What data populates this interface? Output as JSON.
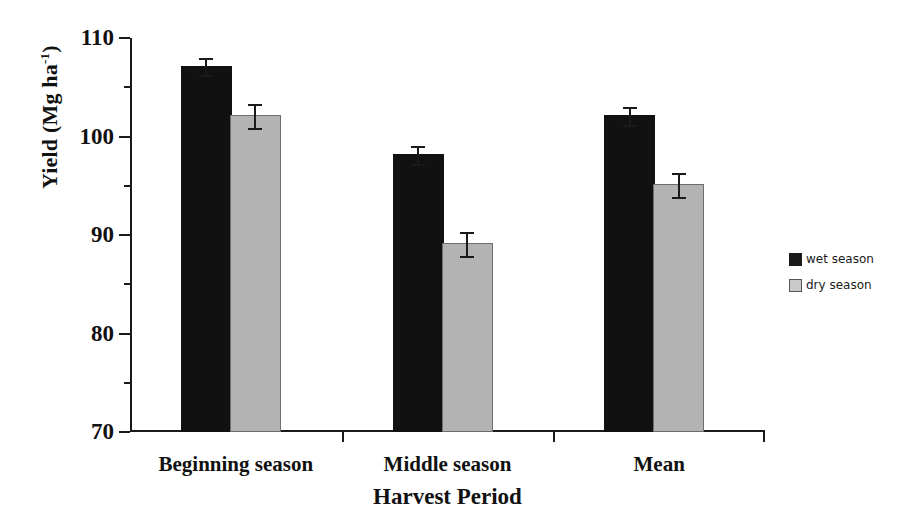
{
  "chart_data": {
    "type": "bar",
    "title": "",
    "xlabel": "Harvest Period",
    "ylabel": "Yield (Mg ha",
    "ylabel_sup": "-1",
    "ylabel_close": ")",
    "categories": [
      "Beginning season",
      "Middle season",
      "Mean"
    ],
    "series": [
      {
        "name": "wet season",
        "color": "#111111",
        "values": [
          107,
          98,
          102
        ],
        "errors": [
          1.0,
          1.0,
          1.0
        ]
      },
      {
        "name": "dry season",
        "color": "#b3b3b3",
        "values": [
          102,
          89,
          95
        ],
        "errors": [
          1.3,
          1.3,
          1.3
        ]
      }
    ],
    "ylim": [
      70,
      110
    ],
    "ytick_labels": [
      "70",
      "80",
      "90",
      "100",
      "110"
    ],
    "ytick_values": [
      70,
      80,
      90,
      100,
      110
    ],
    "yminor_values": [
      75,
      85,
      95,
      105
    ],
    "grid": false,
    "legend_position": "right"
  },
  "legend": {
    "items": [
      {
        "label": "wet season",
        "marker": "filled-square-black"
      },
      {
        "label": "dry season",
        "marker": "filled-square-gray"
      }
    ]
  }
}
